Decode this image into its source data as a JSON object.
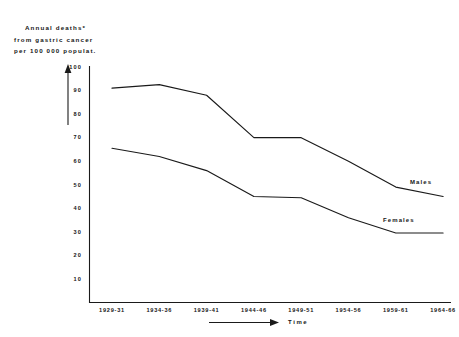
{
  "caption": {
    "line1": "Annual deaths*",
    "line2": "from gastric cancer",
    "line3": "per 100 000 populat."
  },
  "axes": {
    "x_title": "Time",
    "y_ticks": [
      "100",
      "90",
      "80",
      "70",
      "60",
      "50",
      "40",
      "30",
      "20",
      "10"
    ],
    "x_ticks": [
      "1929-31",
      "1934-36",
      "1939-41",
      "1944-46",
      "1949-51",
      "1954-56",
      "1959-61",
      "1964-66"
    ]
  },
  "series_labels": {
    "males": "Males",
    "females": "Females"
  },
  "colors": {
    "line": "#1a1a1a",
    "axis": "#1a1a1a",
    "background": "#ffffff"
  },
  "chart_data": {
    "type": "line",
    "title": "Annual deaths* from gastric cancer per 100 000 populat.",
    "xlabel": "Time",
    "ylabel": "Annual deaths per 100 000 population",
    "categories": [
      "1929-31",
      "1934-36",
      "1939-41",
      "1944-46",
      "1949-51",
      "1954-56",
      "1959-61",
      "1964-66"
    ],
    "series": [
      {
        "name": "Males",
        "values": [
          91,
          92.5,
          88,
          70,
          70,
          60,
          49,
          45
        ]
      },
      {
        "name": "Females",
        "values": [
          65.5,
          62,
          56,
          45,
          44.5,
          36,
          29.5,
          29.5
        ]
      }
    ],
    "ylim": [
      0,
      100
    ],
    "ytick_values": [
      10,
      20,
      30,
      40,
      50,
      60,
      70,
      80,
      90,
      100
    ],
    "grid": false,
    "legend": "inline-right-of-line-ends"
  }
}
